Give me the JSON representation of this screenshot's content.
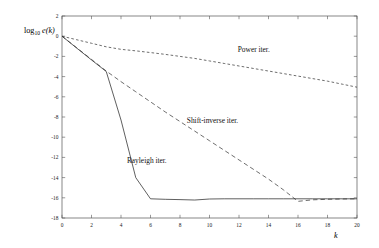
{
  "chart_data": {
    "type": "line",
    "title": "",
    "subtitle": "",
    "xlabel": "k",
    "ylabel": "log10 e(k)",
    "ylabel_base": "log",
    "ylabel_sub": "10",
    "ylabel_fn": "e(k)",
    "xlim": [
      0,
      20
    ],
    "ylim": [
      -18,
      2
    ],
    "xticks": [
      0,
      2,
      4,
      6,
      8,
      10,
      12,
      14,
      16,
      18,
      20
    ],
    "xticklabels": [
      "0",
      "2",
      "4",
      "6",
      "8",
      "10",
      "12",
      "14",
      "16",
      "18",
      "20"
    ],
    "yticks": [
      2,
      0,
      -2,
      -4,
      -6,
      -8,
      -10,
      -12,
      -14,
      -16,
      -18
    ],
    "yticklabels": [
      "2",
      "0",
      "-2",
      "-4",
      "-6",
      "-8",
      "-10",
      "-12",
      "-14",
      "-16",
      "-18"
    ],
    "grid": false,
    "legend_position": "inline-annotations",
    "frame": true,
    "x": [
      0,
      1,
      2,
      3,
      4,
      5,
      6,
      7,
      8,
      9,
      10,
      11,
      12,
      13,
      14,
      15,
      16,
      17,
      18,
      19,
      20
    ],
    "series": [
      {
        "name": "Power iter.",
        "label": "Power iter.",
        "style": "dashed-short",
        "color": "#3d3d3d",
        "dasharray": "2.6,2.2",
        "label_x": 13.0,
        "label_y": -1.55,
        "values": [
          0.0,
          -0.35,
          -0.7,
          -1.05,
          -1.3,
          -1.45,
          -1.62,
          -1.8,
          -2.0,
          -2.2,
          -2.45,
          -2.7,
          -2.95,
          -3.2,
          -3.45,
          -3.7,
          -3.95,
          -4.2,
          -4.45,
          -4.75,
          -5.05
        ]
      },
      {
        "name": "Shift-inverse iter.",
        "label": "Shift-inverse iter.",
        "style": "dashed-long",
        "color": "#3d3d3d",
        "dasharray": "4.4,3.0",
        "label_x": 10.2,
        "label_y": -8.55,
        "values": [
          0.0,
          -1.15,
          -2.3,
          -3.45,
          -4.5,
          -5.5,
          -6.5,
          -7.5,
          -8.45,
          -9.4,
          -10.35,
          -11.3,
          -12.25,
          -13.2,
          -14.15,
          -15.2,
          -16.35,
          -16.2,
          -16.15,
          -16.12,
          -16.1
        ]
      },
      {
        "name": "Rayleigh iter.",
        "label": "Rayleigh iter.",
        "style": "solid",
        "color": "#2b2b2b",
        "dasharray": "none",
        "label_x": 5.75,
        "label_y": -12.55,
        "values": [
          0.0,
          -1.18,
          -2.35,
          -3.5,
          -8.3,
          -14.0,
          -16.1,
          -16.15,
          -16.18,
          -16.22,
          -16.12,
          -16.1,
          -16.1,
          -16.1,
          -16.1,
          -16.1,
          -16.1,
          -16.1,
          -16.1,
          -16.1,
          -16.1
        ]
      }
    ]
  },
  "layout": {
    "plot_left": 62,
    "plot_right": 357,
    "plot_top": 16,
    "plot_bottom": 218,
    "ylabel_x": 24,
    "ylabel_y": 33,
    "xlabel_x": 334,
    "xlabel_y": 238
  }
}
